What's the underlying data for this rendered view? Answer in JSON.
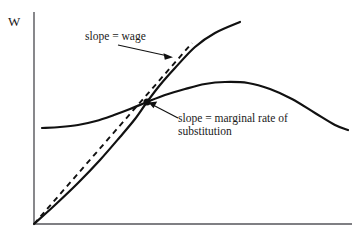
{
  "figure": {
    "title": "",
    "background_color": "#ffffff",
    "ink_color": "#1a1a1a",
    "axis_color": "#55555a"
  },
  "axes": {
    "y_label": "W",
    "x_label": "",
    "origin": {
      "x": 34,
      "y": 224
    },
    "y_top": {
      "x": 34,
      "y": 12
    },
    "x_right": {
      "x": 352,
      "y": 224
    }
  },
  "annotations": [
    {
      "name": "slope-wage",
      "text": "slope = wage",
      "lines": [
        "slope = wage"
      ],
      "arrow_from": {
        "x": 118,
        "y": 45
      },
      "arrow_to": {
        "x": 172,
        "y": 57
      }
    },
    {
      "name": "slope-mrs",
      "text": "slope = marginal rate of substitution",
      "lines": [
        "slope = marginal rate of",
        "substitution"
      ],
      "arrow_from": {
        "x": 178,
        "y": 118
      },
      "arrow_to": {
        "x": 150,
        "y": 104
      }
    }
  ],
  "chart_data": {
    "type": "line",
    "title": "",
    "xlabel": "",
    "ylabel": "W",
    "grid": false,
    "legend": "none",
    "xlim": [
      34,
      352
    ],
    "ylim": [
      224,
      12
    ],
    "tangency_point": {
      "x": 147,
      "y": 102,
      "marker": "filled-dot"
    },
    "series": [
      {
        "name": "production-possibilities-curve",
        "style": "solid",
        "description": "Convex increasing curve from origin through tangency point rising steeply",
        "points": [
          [
            34,
            224
          ],
          [
            55,
            205
          ],
          [
            78,
            183
          ],
          [
            100,
            160
          ],
          [
            120,
            137
          ],
          [
            135,
            119
          ],
          [
            147,
            102
          ],
          [
            160,
            85
          ],
          [
            175,
            68
          ],
          [
            195,
            47
          ],
          [
            215,
            33
          ],
          [
            240,
            22
          ]
        ]
      },
      {
        "name": "indifference-curve",
        "style": "solid",
        "description": "Flat at left, rising through tangency, peaking then falling to the right",
        "points": [
          [
            42,
            128
          ],
          [
            60,
            127
          ],
          [
            78,
            125
          ],
          [
            96,
            121
          ],
          [
            114,
            115
          ],
          [
            130,
            109
          ],
          [
            147,
            102
          ],
          [
            165,
            95
          ],
          [
            185,
            89
          ],
          [
            205,
            84
          ],
          [
            225,
            82
          ],
          [
            248,
            83
          ],
          [
            270,
            89
          ],
          [
            292,
            99
          ],
          [
            315,
            113
          ],
          [
            335,
            125
          ],
          [
            348,
            130
          ]
        ]
      },
      {
        "name": "wage-line",
        "style": "dashed",
        "description": "Straight dashed tangent line through origin and tangency point",
        "points": [
          [
            34,
            224
          ],
          [
            192,
            43
          ]
        ]
      }
    ]
  }
}
